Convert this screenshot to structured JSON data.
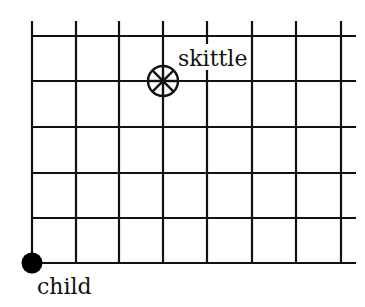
{
  "diagram": {
    "grid": {
      "columns_x": [
        32,
        76,
        119,
        163,
        207,
        252,
        296,
        341
      ],
      "rows_y": [
        36,
        81,
        127,
        173,
        218,
        263
      ],
      "h_line_right_end": 356,
      "v_line_top": 21,
      "stroke": "#111111",
      "stroke_width": 2.2
    },
    "objects": [
      {
        "id": "child",
        "label": "child",
        "symbol": "filled-dot",
        "x": 32,
        "y": 263,
        "radius": 10,
        "color": "#000000"
      },
      {
        "id": "skittle",
        "label": "skittle",
        "symbol": "circle-with-spokes",
        "x": 163,
        "y": 81,
        "radius": 15,
        "color": "#111111"
      }
    ],
    "labels": {
      "child": "child",
      "skittle": "skittle"
    }
  }
}
